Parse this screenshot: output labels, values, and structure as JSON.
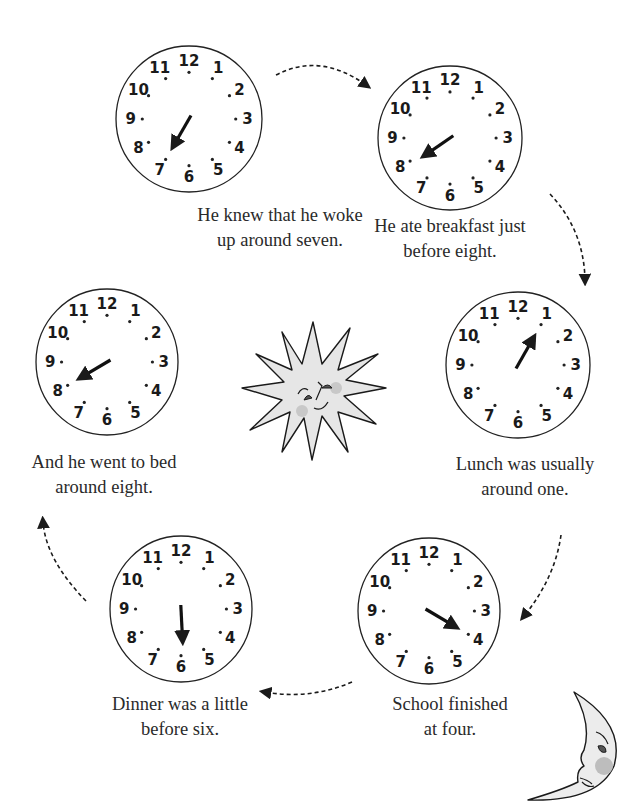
{
  "page": {
    "background": "#ffffff",
    "ink_color": "#1a1a1a",
    "fill_gray": "#e6e6e6",
    "cheek_color": "#b9b9b9"
  },
  "clock_numbers": [
    "12",
    "1",
    "2",
    "3",
    "4",
    "5",
    "6",
    "7",
    "8",
    "9",
    "10",
    "11"
  ],
  "clocks": [
    {
      "id": "wake",
      "hour": 7,
      "caption_line1": "He knew that he woke",
      "caption_line2": "up around seven."
    },
    {
      "id": "breakfast",
      "hour": 7.9,
      "caption_line1": "He ate breakfast just",
      "caption_line2": "before eight."
    },
    {
      "id": "lunch",
      "hour": 1,
      "caption_line1": "Lunch was usually",
      "caption_line2": "around one."
    },
    {
      "id": "school",
      "hour": 4,
      "caption_line1": "School finished",
      "caption_line2": "at four."
    },
    {
      "id": "dinner",
      "hour": 5.9,
      "caption_line1": "Dinner was a little",
      "caption_line2": "before six."
    },
    {
      "id": "bed",
      "hour": 8,
      "caption_line1": "And he went to bed",
      "caption_line2": "around eight."
    }
  ],
  "illustrations": {
    "sun": "sun-with-face",
    "moon": "crescent-moon-with-face"
  },
  "arrows": [
    "wake-to-breakfast",
    "breakfast-to-lunch",
    "lunch-to-school",
    "school-to-dinner",
    "dinner-to-bed"
  ]
}
